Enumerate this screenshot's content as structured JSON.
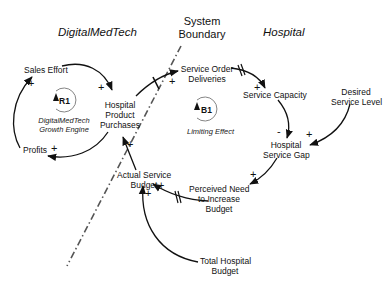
{
  "regions": {
    "left": "DigitalMedTech",
    "right": "Hospital",
    "boundary_line1": "System",
    "boundary_line2": "Boundary"
  },
  "variables": {
    "sales_effort": "Sales Effort",
    "hpp_1": "Hospital",
    "hpp_2": "Product",
    "hpp_3": "Purchases",
    "profits": "Profits",
    "sod_1": "Service Order",
    "sod_2": "Deliveries",
    "service_capacity": "Service Capacity",
    "dsl_1": "Desired",
    "dsl_2": "Service Level",
    "hsg_1": "Hospital",
    "hsg_2": "Service Gap",
    "pnib_1": "Perceived Need",
    "pnib_2": "to Increase",
    "pnib_3": "Budget",
    "asb_1": "Actual Service",
    "asb_2": "Budget",
    "thb_1": "Total Hospital",
    "thb_2": "Budget"
  },
  "loops": {
    "r1": {
      "id": "R1",
      "name_1": "DigitalMedTech",
      "name_2": "Growth Engine",
      "type": "reinforcing"
    },
    "b1": {
      "id": "B1",
      "name": "Limiting Effect",
      "type": "balancing"
    }
  },
  "polarities": {
    "profits_to_sales": "+",
    "sales_to_hpp": "+",
    "hpp_to_profits": "+",
    "hpp_to_sod": "+",
    "sod_to_capacity": "+",
    "capacity_to_gap": "-",
    "desired_to_gap": "+",
    "gap_to_need": "+",
    "need_to_budget": "+",
    "total_to_budget": "+",
    "budget_to_hpp": "+"
  },
  "links": [
    {
      "from": "Profits",
      "to": "Sales Effort",
      "polarity": "+",
      "delay": false
    },
    {
      "from": "Sales Effort",
      "to": "Hospital Product Purchases",
      "polarity": "+",
      "delay": false
    },
    {
      "from": "Hospital Product Purchases",
      "to": "Profits",
      "polarity": "+",
      "delay": false
    },
    {
      "from": "Hospital Product Purchases",
      "to": "Service Order Deliveries",
      "polarity": "+",
      "delay": true
    },
    {
      "from": "Service Order Deliveries",
      "to": "Service Capacity",
      "polarity": "+",
      "delay": true
    },
    {
      "from": "Service Capacity",
      "to": "Hospital Service Gap",
      "polarity": "-",
      "delay": false
    },
    {
      "from": "Desired Service Level",
      "to": "Hospital Service Gap",
      "polarity": "+",
      "delay": false
    },
    {
      "from": "Hospital Service Gap",
      "to": "Perceived Need to Increase Budget",
      "polarity": "+",
      "delay": false
    },
    {
      "from": "Perceived Need to Increase Budget",
      "to": "Actual Service Budget",
      "polarity": "+",
      "delay": true
    },
    {
      "from": "Total Hospital Budget",
      "to": "Actual Service Budget",
      "polarity": "+",
      "delay": false
    },
    {
      "from": "Actual Service Budget",
      "to": "Hospital Product Purchases",
      "polarity": "+",
      "delay": false
    }
  ],
  "colors": {
    "ink": "#111111",
    "boundary": "#555555",
    "background": "#ffffff"
  }
}
